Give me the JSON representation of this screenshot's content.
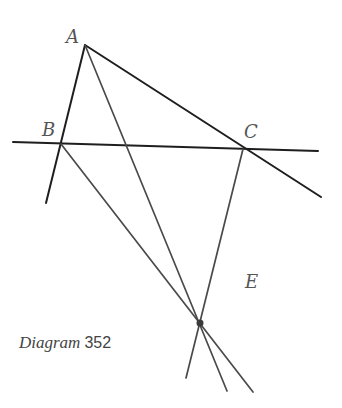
{
  "caption": {
    "word": "Diagram",
    "number": "352"
  },
  "labels": {
    "A": "A",
    "B": "B",
    "C": "C",
    "E": "E"
  },
  "colors": {
    "stroke_dark": "#1e1e1e",
    "stroke_mid": "#4a4a4a",
    "label": "#555555",
    "background": "#ffffff"
  },
  "points": {
    "A": [
      85,
      45
    ],
    "B": [
      61,
      144
    ],
    "C": [
      243,
      149
    ],
    "E": [
      200,
      323
    ]
  },
  "lines": [
    {
      "name": "line-BC",
      "from": [
        13,
        142
      ],
      "to": [
        318,
        151
      ]
    },
    {
      "name": "line-AB",
      "from": [
        85,
        45
      ],
      "to": [
        46,
        203
      ]
    },
    {
      "name": "line-AC",
      "from": [
        85,
        45
      ],
      "to": [
        321,
        197
      ]
    },
    {
      "name": "line-A-through-E",
      "from": [
        85,
        45
      ],
      "to": [
        227,
        391
      ]
    },
    {
      "name": "line-B-through-E",
      "from": [
        61,
        144
      ],
      "to": [
        253,
        392
      ]
    },
    {
      "name": "line-C-through-E",
      "from": [
        243,
        149
      ],
      "to": [
        186,
        378
      ]
    }
  ]
}
